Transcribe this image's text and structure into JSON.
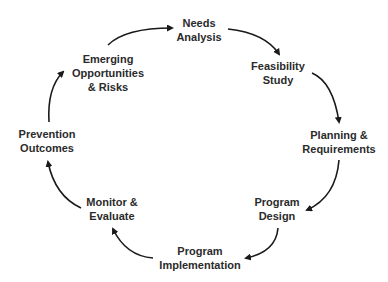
{
  "diagram": {
    "type": "cycle",
    "nodes": [
      {
        "id": "needs",
        "lines": [
          "Needs",
          "Analysis"
        ]
      },
      {
        "id": "feasibility",
        "lines": [
          "Feasibility",
          "Study"
        ]
      },
      {
        "id": "planning",
        "lines": [
          "Planning &",
          "Requirements"
        ]
      },
      {
        "id": "design",
        "lines": [
          "Program",
          "Design"
        ]
      },
      {
        "id": "implementation",
        "lines": [
          "Program",
          "Implementation"
        ]
      },
      {
        "id": "monitor",
        "lines": [
          "Monitor &",
          "Evaluate"
        ]
      },
      {
        "id": "prevention",
        "lines": [
          "Prevention",
          "Outcomes"
        ]
      },
      {
        "id": "emerging",
        "lines": [
          "Emerging",
          "Opportunities",
          "& Risks"
        ]
      }
    ],
    "edges": [
      {
        "from": "needs",
        "to": "feasibility"
      },
      {
        "from": "feasibility",
        "to": "planning"
      },
      {
        "from": "planning",
        "to": "design"
      },
      {
        "from": "design",
        "to": "implementation"
      },
      {
        "from": "implementation",
        "to": "monitor"
      },
      {
        "from": "monitor",
        "to": "prevention"
      },
      {
        "from": "prevention",
        "to": "emerging"
      },
      {
        "from": "emerging",
        "to": "needs"
      }
    ],
    "colors": {
      "text": "#2b2b2b",
      "arrow": "#1a1a1a",
      "background": "#ffffff"
    }
  }
}
